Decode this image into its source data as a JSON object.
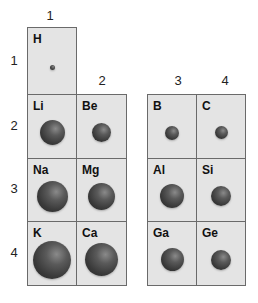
{
  "group_labels": [
    {
      "text": "1",
      "x": 40,
      "y": 8
    },
    {
      "text": "2",
      "x": 92,
      "y": 73
    },
    {
      "text": "3",
      "x": 168,
      "y": 73
    },
    {
      "text": "4",
      "x": 215,
      "y": 73
    }
  ],
  "period_labels": [
    {
      "text": "1",
      "x": 4,
      "y": 53
    },
    {
      "text": "2",
      "x": 4,
      "y": 118
    },
    {
      "text": "3",
      "x": 4,
      "y": 181
    },
    {
      "text": "4",
      "x": 4,
      "y": 245
    }
  ],
  "elements": [
    {
      "symbol": "H",
      "group": 1,
      "period": 1,
      "x": 27,
      "y": 27,
      "w": 50,
      "h": 68,
      "atom_d": 5
    },
    {
      "symbol": "Li",
      "group": 1,
      "period": 2,
      "x": 27,
      "y": 94,
      "w": 50,
      "h": 65,
      "atom_d": 25
    },
    {
      "symbol": "Be",
      "group": 2,
      "period": 2,
      "x": 76,
      "y": 94,
      "w": 51,
      "h": 65,
      "atom_d": 19
    },
    {
      "symbol": "Na",
      "group": 1,
      "period": 3,
      "x": 27,
      "y": 158,
      "w": 50,
      "h": 64,
      "atom_d": 31
    },
    {
      "symbol": "Mg",
      "group": 2,
      "period": 3,
      "x": 76,
      "y": 158,
      "w": 51,
      "h": 64,
      "atom_d": 27
    },
    {
      "symbol": "K",
      "group": 1,
      "period": 4,
      "x": 27,
      "y": 221,
      "w": 50,
      "h": 65,
      "atom_d": 38
    },
    {
      "symbol": "Ca",
      "group": 2,
      "period": 4,
      "x": 76,
      "y": 221,
      "w": 51,
      "h": 65,
      "atom_d": 33
    },
    {
      "symbol": "B",
      "group": 3,
      "period": 2,
      "x": 147,
      "y": 94,
      "w": 50,
      "h": 65,
      "atom_d": 14
    },
    {
      "symbol": "C",
      "group": 4,
      "period": 2,
      "x": 196,
      "y": 94,
      "w": 50,
      "h": 65,
      "atom_d": 13
    },
    {
      "symbol": "Al",
      "group": 3,
      "period": 3,
      "x": 147,
      "y": 158,
      "w": 50,
      "h": 64,
      "atom_d": 24
    },
    {
      "symbol": "Si",
      "group": 4,
      "period": 3,
      "x": 196,
      "y": 158,
      "w": 50,
      "h": 64,
      "atom_d": 20
    },
    {
      "symbol": "Ga",
      "group": 3,
      "period": 4,
      "x": 147,
      "y": 221,
      "w": 50,
      "h": 65,
      "atom_d": 23
    },
    {
      "symbol": "Ge",
      "group": 4,
      "period": 4,
      "x": 196,
      "y": 221,
      "w": 50,
      "h": 65,
      "atom_d": 20
    }
  ]
}
